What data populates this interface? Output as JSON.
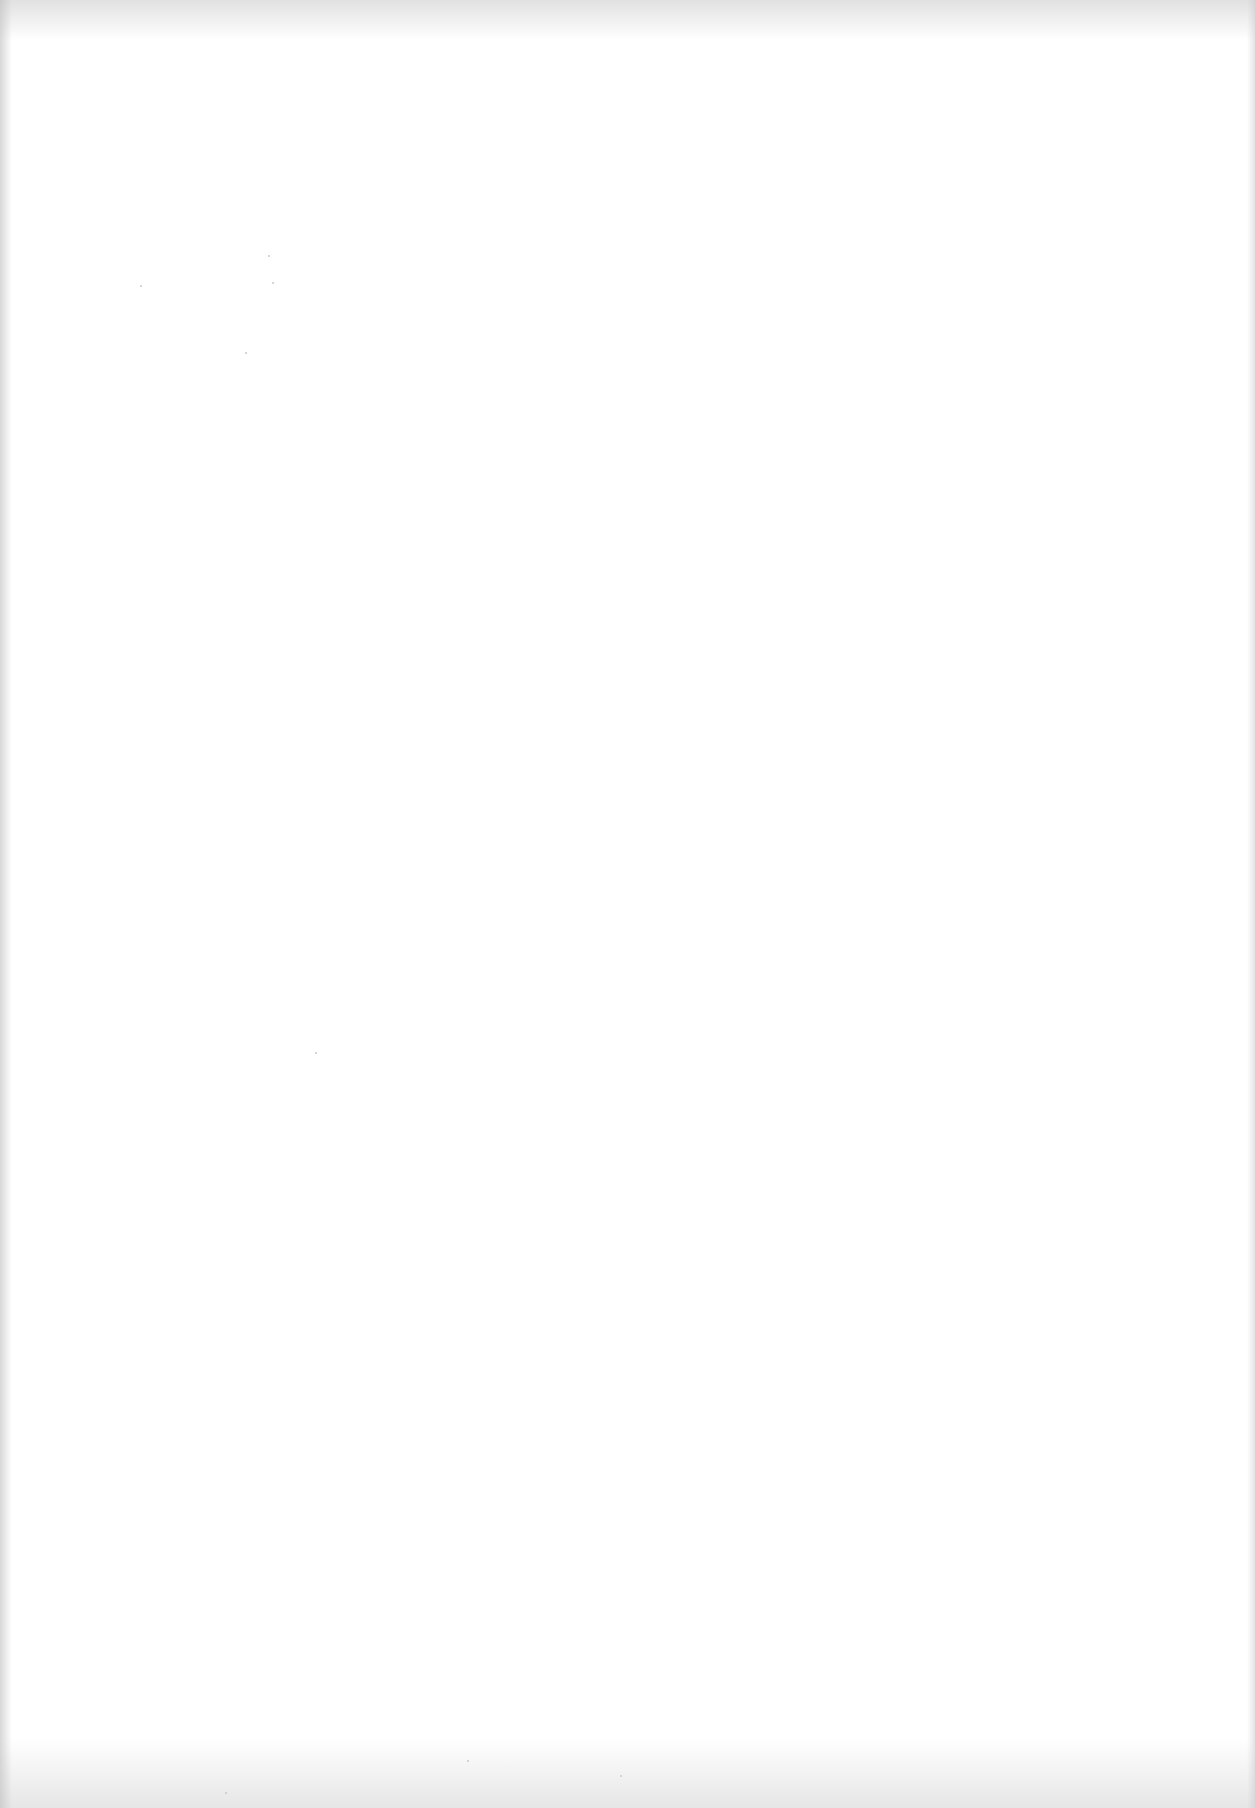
{
  "document": {
    "type": "blank-scanned-page",
    "text": ""
  }
}
